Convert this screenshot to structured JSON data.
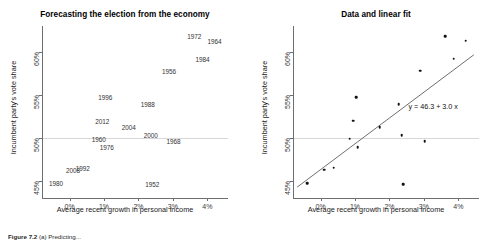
{
  "figure": {
    "caption_prefix": "Figure 7.2",
    "caption_text": "(a) Predicting...",
    "width": 501,
    "height": 242
  },
  "panels": [
    {
      "id": "left",
      "title": "Forecasting the election from the economy",
      "xlabel": "Average recent growth in personal income",
      "ylabel": "Incumbent party's vote share",
      "xticks": [
        "0%",
        "1%",
        "2%",
        "3%",
        "4%"
      ],
      "yticks": [
        "45%",
        "50%",
        "55%",
        "60%"
      ]
    },
    {
      "id": "right",
      "title": "Data and linear fit",
      "xlabel": "Average recent growth in personal income",
      "ylabel": "Incumbent party's vote share",
      "xticks": [
        "0%",
        "1%",
        "2%",
        "3%",
        "4%"
      ],
      "yticks": [
        "45%",
        "50%",
        "55%",
        "60%"
      ],
      "equation": "y = 46.3 + 3.0 x"
    }
  ],
  "chart_data": {
    "type": "scatter",
    "title": "Forecasting the election from the economy",
    "subtitle": "Data and linear fit",
    "xlabel": "Average recent growth in personal income",
    "ylabel": "Incumbent party's vote share",
    "xlim": [
      -0.8,
      4.6
    ],
    "ylim": [
      43.0,
      63.0
    ],
    "xtick_values": [
      0,
      1,
      2,
      3,
      4
    ],
    "xtick_labels": [
      "0%",
      "1%",
      "2%",
      "3%",
      "4%"
    ],
    "ytick_values": [
      45,
      50,
      55,
      60
    ],
    "ytick_labels": [
      "45%",
      "50%",
      "55%",
      "60%"
    ],
    "grid": "horizontal-50-only",
    "legend": "none",
    "point_labels_are": "election year",
    "fit": {
      "equation": "y = 46.3 + 3.0 x",
      "intercept": 46.3,
      "slope": 3.0,
      "drawn_in": "right panel"
    },
    "points": [
      {
        "year": "1952",
        "x": 2.4,
        "y": 44.6
      },
      {
        "year": "1956",
        "x": 2.89,
        "y": 57.8
      },
      {
        "year": "1960",
        "x": 0.85,
        "y": 49.9
      },
      {
        "year": "1964",
        "x": 4.21,
        "y": 61.3
      },
      {
        "year": "1968",
        "x": 3.02,
        "y": 49.6
      },
      {
        "year": "1972",
        "x": 3.62,
        "y": 61.8
      },
      {
        "year": "1976",
        "x": 1.08,
        "y": 48.9
      },
      {
        "year": "1980",
        "x": -0.39,
        "y": 44.7
      },
      {
        "year": "1984",
        "x": 3.86,
        "y": 59.2
      },
      {
        "year": "1988",
        "x": 2.27,
        "y": 53.9
      },
      {
        "year": "1992",
        "x": 0.38,
        "y": 46.5
      },
      {
        "year": "1996",
        "x": 1.04,
        "y": 54.7
      },
      {
        "year": "2000",
        "x": 2.36,
        "y": 50.3
      },
      {
        "year": "2004",
        "x": 1.72,
        "y": 51.2
      },
      {
        "year": "2008",
        "x": 0.1,
        "y": 46.3
      },
      {
        "year": "2012",
        "x": 0.95,
        "y": 52.0
      }
    ]
  }
}
